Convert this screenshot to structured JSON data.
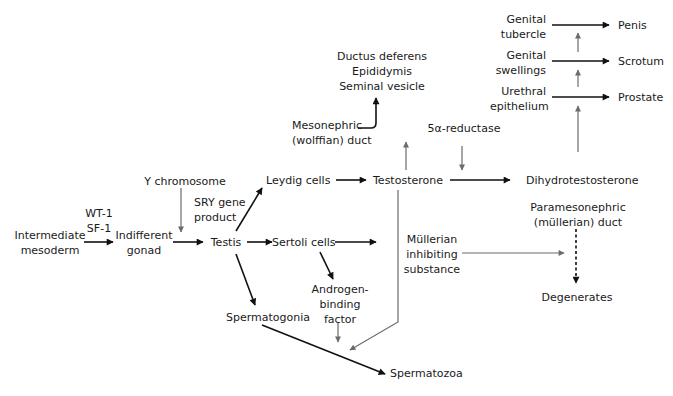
{
  "diagram": {
    "colors": {
      "black_arrow": "#111111",
      "gray_arrow": "#6b6b6b",
      "text": "#1a1a1a"
    },
    "nodes": {
      "intermediate_mesoderm": "Intermediate\nmesoderm",
      "wt1_sf1": "WT-1\nSF-1",
      "indifferent_gonad": "Indifferent\ngonad",
      "y_chromosome": "Y chromosome",
      "sry_gene_product": "SRY gene\nproduct",
      "testis": "Testis",
      "leydig_cells": "Leydig cells",
      "sertoli_cells": "Sertoli cells",
      "spermatogonia": "Spermatogonia",
      "androgen_binding_factor": "Androgen-\nbinding\nfactor",
      "spermatozoa": "Spermatozoa",
      "testosterone": "Testosterone",
      "mesonephric_duct": "Mesonephric\n(wolffian) duct",
      "wolffian_derivatives": "Ductus deferens\nEpididymis\nSeminal vesicle",
      "five_alpha_reductase": "5α-reductase",
      "dihydrotestosterone": "Dihydrotestosterone",
      "mullerian_inhibiting_substance": "Müllerian\ninhibiting\nsubstance",
      "paramesonephric_duct": "Paramesonephric\n(müllerian) duct",
      "degenerates": "Degenerates",
      "urethral_epithelium": "Urethral\nepithelium",
      "genital_swellings": "Genital\nswellings",
      "genital_tubercle": "Genital\ntubercle",
      "prostate": "Prostate",
      "scrotum": "Scrotum",
      "penis": "Penis"
    },
    "edges": [
      {
        "from": "intermediate_mesoderm",
        "to": "indifferent_gonad",
        "label": "WT-1 SF-1",
        "style": "black"
      },
      {
        "from": "indifferent_gonad",
        "to": "testis",
        "style": "black"
      },
      {
        "from": "y_chromosome",
        "to": "testis",
        "style": "gray"
      },
      {
        "from": "testis",
        "to": "leydig_cells",
        "style": "black"
      },
      {
        "from": "testis",
        "to": "sertoli_cells",
        "style": "black"
      },
      {
        "from": "testis",
        "to": "spermatogonia",
        "style": "black"
      },
      {
        "from": "leydig_cells",
        "to": "testosterone",
        "style": "black"
      },
      {
        "from": "sertoli_cells",
        "to": "mullerian_inhibiting_substance",
        "style": "black"
      },
      {
        "from": "sertoli_cells",
        "to": "androgen_binding_factor",
        "style": "black"
      },
      {
        "from": "spermatogonia",
        "to": "spermatozoa",
        "style": "black"
      },
      {
        "from": "androgen_binding_factor",
        "to": "spermatozoa",
        "style": "gray"
      },
      {
        "from": "testosterone",
        "to": "spermatozoa",
        "style": "gray"
      },
      {
        "from": "testosterone",
        "to": "mesonephric_duct",
        "style": "gray"
      },
      {
        "from": "mesonephric_duct",
        "to": "wolffian_derivatives",
        "style": "black"
      },
      {
        "from": "testosterone",
        "to": "dihydrotestosterone",
        "style": "black"
      },
      {
        "from": "five_alpha_reductase",
        "to": "dihydrotestosterone",
        "style": "gray"
      },
      {
        "from": "mullerian_inhibiting_substance",
        "to": "paramesonephric_duct",
        "style": "gray"
      },
      {
        "from": "paramesonephric_duct",
        "to": "degenerates",
        "style": "dashed"
      },
      {
        "from": "dihydrotestosterone",
        "to": "urethral_epithelium",
        "style": "gray"
      },
      {
        "from": "urethral_epithelium",
        "to": "prostate",
        "style": "black"
      },
      {
        "from": "genital_swellings",
        "to": "scrotum",
        "style": "black"
      },
      {
        "from": "genital_tubercle",
        "to": "penis",
        "style": "black"
      }
    ]
  }
}
